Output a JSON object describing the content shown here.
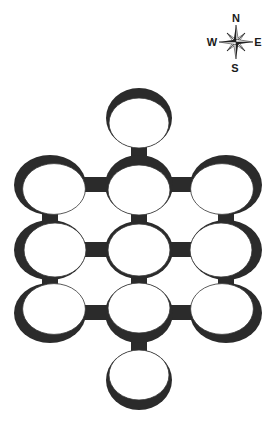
{
  "compass": {
    "center": [
      236,
      42
    ],
    "labels": {
      "north": "N",
      "south": "S",
      "east": "E",
      "west": "W"
    }
  },
  "colors": {
    "background": "#ffffff",
    "ring_dark": "#2b2b2b",
    "ring_fill": "#ffffff",
    "outline": "#333333"
  },
  "rooms": [
    {
      "id": "top",
      "cx": 139,
      "cy": 118,
      "rx": 33,
      "ry": 30,
      "shade": "top"
    },
    {
      "id": "r1-left",
      "cx": 50,
      "cy": 185,
      "rx": 36,
      "ry": 30,
      "shade": "top-left"
    },
    {
      "id": "r1-center",
      "cx": 139,
      "cy": 185,
      "rx": 34,
      "ry": 30,
      "shade": "top"
    },
    {
      "id": "r1-right",
      "cx": 226,
      "cy": 185,
      "rx": 36,
      "ry": 30,
      "shade": "top-right"
    },
    {
      "id": "r2-left",
      "cx": 50,
      "cy": 250,
      "rx": 36,
      "ry": 30,
      "shade": "left"
    },
    {
      "id": "r2-center",
      "cx": 139,
      "cy": 250,
      "rx": 34,
      "ry": 29,
      "shade": "none"
    },
    {
      "id": "r2-right",
      "cx": 226,
      "cy": 250,
      "rx": 36,
      "ry": 30,
      "shade": "right"
    },
    {
      "id": "r3-left",
      "cx": 50,
      "cy": 313,
      "rx": 36,
      "ry": 30,
      "shade": "bottom-left"
    },
    {
      "id": "r3-center",
      "cx": 139,
      "cy": 313,
      "rx": 34,
      "ry": 30,
      "shade": "bottom"
    },
    {
      "id": "r3-right",
      "cx": 226,
      "cy": 313,
      "rx": 36,
      "ry": 30,
      "shade": "bottom-right"
    },
    {
      "id": "bottom",
      "cx": 139,
      "cy": 380,
      "rx": 33,
      "ry": 30,
      "shade": "bottom"
    }
  ],
  "corridors": [
    {
      "from": "top",
      "to": "r1-center"
    },
    {
      "from": "r1-left",
      "to": "r1-center"
    },
    {
      "from": "r1-center",
      "to": "r1-right"
    },
    {
      "from": "r1-left",
      "to": "r2-left"
    },
    {
      "from": "r1-center",
      "to": "r2-center"
    },
    {
      "from": "r1-right",
      "to": "r2-right"
    },
    {
      "from": "r2-left",
      "to": "r2-center"
    },
    {
      "from": "r2-center",
      "to": "r2-right"
    },
    {
      "from": "r2-left",
      "to": "r3-left"
    },
    {
      "from": "r2-center",
      "to": "r3-center"
    },
    {
      "from": "r2-right",
      "to": "r3-right"
    },
    {
      "from": "r3-left",
      "to": "r3-center"
    },
    {
      "from": "r3-center",
      "to": "r3-right"
    },
    {
      "from": "r3-center",
      "to": "bottom"
    }
  ]
}
